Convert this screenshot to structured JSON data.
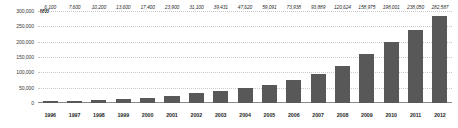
{
  "chart_data": {
    "type": "bar",
    "title": "",
    "subtitle": "",
    "xlabel": "",
    "ylabel": "MW",
    "unit_label": "MW",
    "ylim": [
      0,
      300000
    ],
    "grid": true,
    "legend": "none",
    "bar_color": "#585858",
    "gridline_color": "#c9c9c9",
    "axis_color": "#8a8a8a",
    "y_ticks": [
      {
        "value": 300000,
        "label": "300,000"
      },
      {
        "value": 250000,
        "label": "250,000"
      },
      {
        "value": 200000,
        "label": "200,000"
      },
      {
        "value": 150000,
        "label": "150,000"
      },
      {
        "value": 100000,
        "label": "100,000"
      },
      {
        "value": 50000,
        "label": "50,000"
      }
    ],
    "zero_label": "0",
    "categories": [
      "1996",
      "1997",
      "1998",
      "1999",
      "2000",
      "2001",
      "2002",
      "2003",
      "2004",
      "2005",
      "2006",
      "2007",
      "2008",
      "2009",
      "2010",
      "2011",
      "2012"
    ],
    "values": [
      6100,
      7600,
      10200,
      13600,
      17400,
      23900,
      31100,
      39431,
      47620,
      59091,
      73938,
      93889,
      120624,
      158975,
      198001,
      238050,
      282587
    ],
    "value_labels": [
      "6,100",
      "7,600",
      "10,200",
      "13,600",
      "17,400",
      "23,900",
      "31,100",
      "39,431",
      "47,620",
      "59,091",
      "73,938",
      "93,889",
      "120,624",
      "158,975",
      "198,001",
      "238,050",
      "282,587"
    ]
  }
}
